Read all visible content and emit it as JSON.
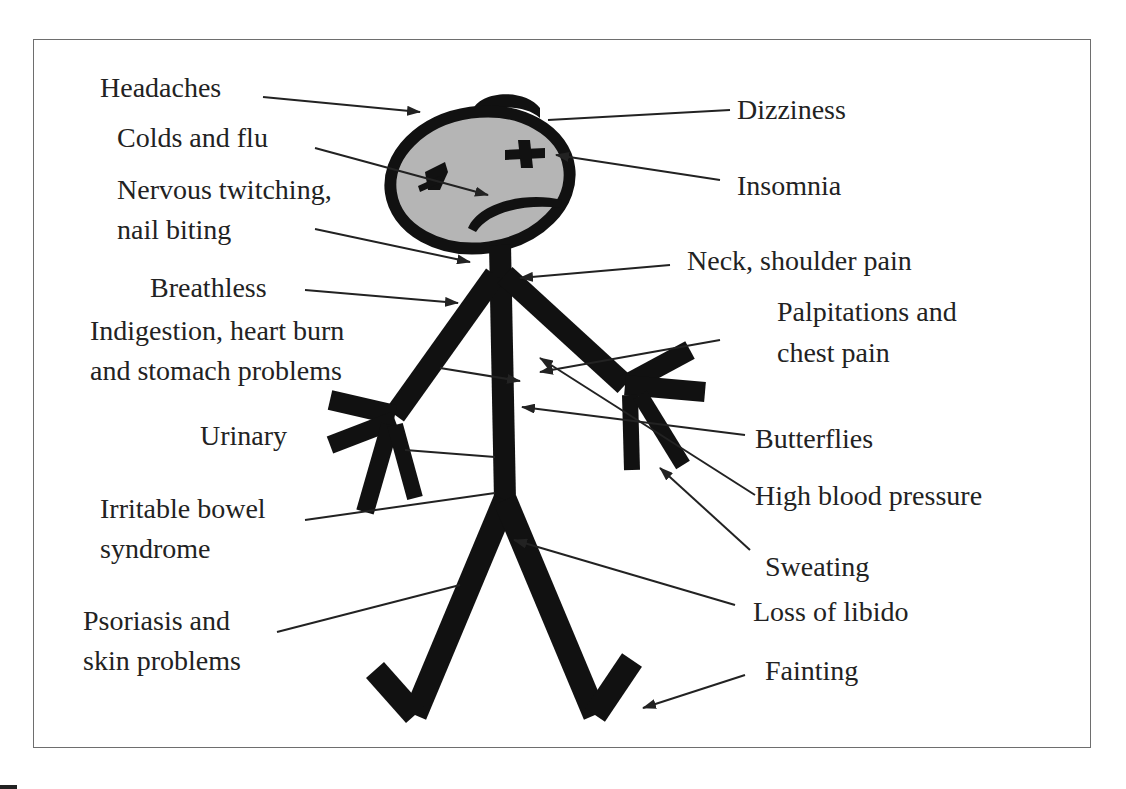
{
  "diagram": {
    "type": "stress-symptoms-stick-figure",
    "labels": {
      "headaches": "Headaches",
      "colds": "Colds and flu",
      "nervous1": "Nervous twitching,",
      "nervous2": "nail biting",
      "breathless": "Breathless",
      "indigestion1": "Indigestion, heart burn",
      "indigestion2": "and stomach problems",
      "urinary": "Urinary",
      "ibs1": "Irritable bowel",
      "ibs2": "syndrome",
      "psoriasis1": "Psoriasis and",
      "psoriasis2": "skin problems",
      "dizziness": "Dizziness",
      "insomnia": "Insomnia",
      "neck": "Neck, shoulder pain",
      "palpitations1": "Palpitations and",
      "palpitations2": "chest pain",
      "butterflies": "Butterflies",
      "bloodpressure": "High blood pressure",
      "sweating": "Sweating",
      "libido": "Loss of libido",
      "fainting": "Fainting"
    },
    "colors": {
      "ink": "#111111",
      "face": "#b5b5b5",
      "text": "#222222",
      "border": "#6e6e6e"
    }
  }
}
